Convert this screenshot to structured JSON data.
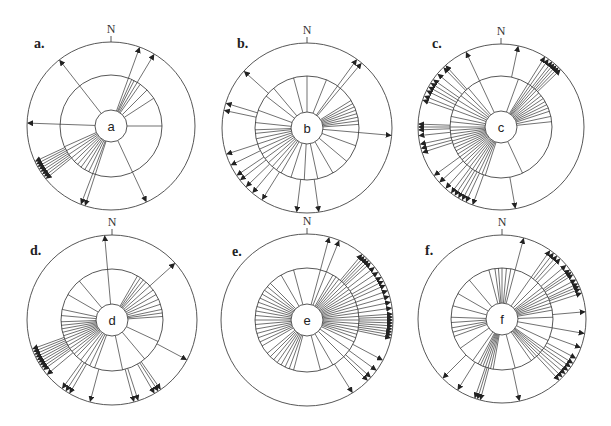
{
  "figure": {
    "north_label": "N",
    "line_color": "#333333",
    "panels": [
      {
        "id": "a",
        "label": "a.",
        "center_text": "a",
        "cx": 111,
        "cy": 126,
        "r_inner": 16,
        "r_middle": 51,
        "r_outer": 84,
        "label_x": 34,
        "label_y": 48,
        "spokes": [
          20,
          24,
          27,
          31,
          35,
          45,
          57,
          90,
          155,
          198,
          201,
          206,
          211,
          216,
          221,
          226,
          231,
          236,
          241,
          246,
          272,
          322
        ],
        "arrows": [
          20,
          31,
          155,
          198,
          201,
          231,
          233,
          235,
          237,
          239,
          241,
          243,
          245,
          272,
          322
        ]
      },
      {
        "id": "b",
        "label": "b.",
        "center_text": "b",
        "cx": 307,
        "cy": 128,
        "r_inner": 16,
        "r_middle": 52,
        "r_outer": 85,
        "label_x": 237,
        "label_y": 48,
        "spokes": [
          0,
          22,
          36,
          40,
          58,
          62,
          66,
          70,
          74,
          78,
          82,
          86,
          95,
          110,
          130,
          150,
          168,
          183,
          198,
          210,
          216,
          222,
          228,
          234,
          240,
          246,
          252,
          258,
          264,
          268,
          276,
          290,
          308,
          320,
          345
        ],
        "arrows": [
          36,
          40,
          95,
          172,
          187,
          212,
          220,
          226,
          232,
          236,
          244,
          252,
          282,
          287,
          312
        ]
      },
      {
        "id": "c",
        "label": "c.",
        "center_text": "c",
        "cx": 501,
        "cy": 127,
        "r_inner": 16,
        "r_middle": 51,
        "r_outer": 83,
        "label_x": 432,
        "label_y": 48,
        "spokes": [
          20,
          32,
          35,
          38,
          41,
          44,
          48,
          52,
          56,
          60,
          64,
          68,
          72,
          78,
          84,
          155,
          198,
          202,
          206,
          210,
          214,
          218,
          222,
          226,
          230,
          234,
          238,
          242,
          246,
          250,
          254,
          258,
          262,
          266,
          270,
          276,
          282,
          290,
          296,
          302,
          308,
          314,
          320,
          335
        ],
        "arrows": [
          12,
          32,
          35,
          38,
          40,
          42,
          44,
          46,
          170,
          200,
          205,
          208,
          211,
          214,
          217,
          222,
          228,
          234,
          252,
          255,
          258,
          264,
          268,
          270,
          272,
          289,
          292,
          296,
          299,
          302,
          305,
          310,
          316,
          318,
          335
        ]
      },
      {
        "id": "d",
        "label": "d.",
        "center_text": "d",
        "cx": 112,
        "cy": 320,
        "r_inner": 16,
        "r_middle": 51,
        "r_outer": 85,
        "label_x": 30,
        "label_y": 255,
        "spokes": [
          355,
          30,
          34,
          38,
          42,
          48,
          54,
          60,
          66,
          72,
          78,
          82,
          86,
          115,
          140,
          168,
          200,
          206,
          212,
          218,
          224,
          228,
          232,
          236,
          240,
          244,
          248,
          252,
          256,
          260,
          264,
          268,
          275,
          282,
          300,
          320
        ],
        "arrows": [
          355,
          48,
          118,
          162,
          165,
          150,
          147,
          145,
          195,
          210,
          213,
          216,
          230,
          234,
          236,
          238,
          240,
          242,
          244,
          246,
          248,
          250
        ]
      },
      {
        "id": "e",
        "label": "e.",
        "center_text": "e",
        "cx": 307,
        "cy": 320,
        "r_inner": 16,
        "r_middle": 52,
        "r_outer": 86,
        "label_x": 232,
        "label_y": 256,
        "spokes": [
          15,
          22,
          30,
          34,
          38,
          42,
          46,
          50,
          54,
          58,
          62,
          66,
          70,
          74,
          78,
          82,
          86,
          90,
          94,
          98,
          102,
          106,
          110,
          115,
          125,
          135,
          150,
          165,
          195,
          200,
          205,
          210,
          215,
          220,
          225,
          230,
          240,
          245,
          250,
          255,
          260,
          265,
          270,
          275,
          280,
          285,
          290,
          295,
          300,
          305,
          310,
          315,
          330,
          345
        ],
        "arrows": [
          15,
          22,
          40,
          42,
          44,
          46,
          48,
          52,
          56,
          60,
          63,
          66,
          70,
          74,
          78,
          82,
          86,
          88,
          90,
          92,
          94,
          96,
          98,
          100,
          102,
          118,
          126,
          132,
          135,
          148
        ]
      },
      {
        "id": "f",
        "label": "f.",
        "center_text": "f",
        "cx": 502,
        "cy": 319,
        "r_inner": 16,
        "r_middle": 51,
        "r_outer": 84,
        "label_x": 425,
        "label_y": 255,
        "spokes": [
          345,
          352,
          356,
          0,
          5,
          10,
          15,
          35,
          45,
          52,
          56,
          60,
          64,
          68,
          72,
          76,
          80,
          88,
          100,
          115,
          125,
          128,
          131,
          134,
          137,
          140,
          145,
          165,
          190,
          193,
          196,
          199,
          202,
          205,
          208,
          215,
          235,
          250,
          255,
          260,
          266,
          272,
          285,
          300,
          320
        ],
        "arrows": [
          15,
          35,
          38,
          41,
          44,
          50,
          54,
          56,
          58,
          62,
          65,
          67,
          69,
          72,
          85,
          100,
          110,
          118,
          122,
          125,
          128,
          131,
          134,
          137,
          168,
          195,
          197,
          199,
          212,
          225
        ]
      }
    ]
  }
}
